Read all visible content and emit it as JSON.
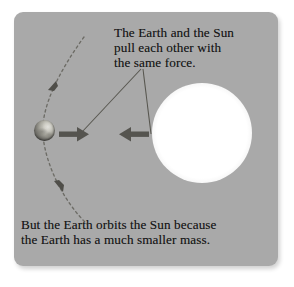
{
  "figure": {
    "kind": "science-illustration",
    "panel_bg_color": "#a9a9a9",
    "text_color": "#171717"
  },
  "captions": {
    "top": "The Earth and the Sun\npull each other with\nthe same force.",
    "bottom": "But the Earth orbits the Sun because\nthe Earth has a much smaller mass."
  },
  "bodies": {
    "sun": {
      "label": "Sun",
      "color": "#ffffff",
      "center": "200,133",
      "radius_px": 37
    },
    "earth": {
      "label": "Earth",
      "color": "#6e6d67",
      "center": "44,134",
      "radius_px": 10
    }
  },
  "force_arrows": [
    {
      "name": "earth-force-arrow",
      "direction": "right",
      "meaning": "force on Earth toward the Sun",
      "color": "#55544f"
    },
    {
      "name": "sun-force-arrow",
      "direction": "left",
      "meaning": "force on Sun toward the Earth",
      "color": "#55544f"
    }
  ],
  "orbit": {
    "name": "earth-orbit-path",
    "style": "dashed",
    "color": "#6d6c66",
    "direction_markers": 2,
    "direction": "clockwise (downward along visible arc)"
  },
  "leader_lines": {
    "count": 2,
    "color": "#57564f",
    "meaning": "connects caption to both force arrows"
  }
}
